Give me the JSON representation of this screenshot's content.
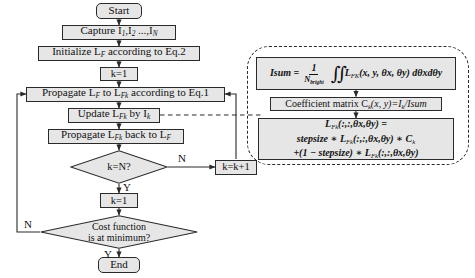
{
  "diagram": {
    "colors": {
      "node_fill": "#e6e6e6",
      "stroke": "#2a2a2a",
      "text": "#111111",
      "background": "#ffffff"
    },
    "nodes": {
      "start": "Start",
      "capture": "Capture I",
      "capture_sub1": "1",
      "capture_mid": ",I",
      "capture_sub2": "2",
      "capture_tail": " ...,I",
      "capture_subN": "N",
      "initialize": "Initialize L",
      "initialize_sub": "F",
      "initialize_tail": " according to Eq.2",
      "k_init": "k=1",
      "propagate_fwd_a": "Propagate L",
      "propagate_fwd_sub1": "F",
      "propagate_fwd_b": "  to L",
      "propagate_fwd_sub2": "Fk",
      "propagate_fwd_c": " according to Eq.1",
      "update_a": "Update L",
      "update_sub1": "Fk",
      "update_b": " by I",
      "update_sub2": "k",
      "propagate_back_a": "Propagate L",
      "propagate_back_sub1": "Fk",
      "propagate_back_b": "  back to L",
      "propagate_back_sub2": "F",
      "decision_k": "k=N?",
      "increment": "k=k+1",
      "k_reset": "k=1",
      "decision_cost_line1": "Cost function",
      "decision_cost_line2": "is at minimum?",
      "end": "End"
    },
    "edge_labels": {
      "k_no": "N",
      "k_yes": "Y",
      "cost_no": "N",
      "cost_yes": "Y"
    },
    "panel": {
      "eq_isum": {
        "lhs": "Isum",
        "equals": "=",
        "frac_num": "1",
        "frac_den": "N",
        "frac_den_sub": "bright",
        "integral": "∬",
        "body": "L",
        "body_sub": "FK",
        "args": "(x, y, θx, θy)",
        "differential": "dθxdθy"
      },
      "eq_coeff": {
        "prefix": "Coefficient matrix C",
        "sub1": "k",
        "args": "(x, y)=I",
        "sub2": "k",
        "suffix": "/Isum"
      },
      "eq_update": {
        "line1_a": "L",
        "line1_sub": "Fk",
        "line1_b": "(:,:,θx,θy) =",
        "line2_a": "stepsize ∗ L",
        "line2_sub1": "Fk",
        "line2_b": "(:,:,θx,θy) ∗ C",
        "line2_sub2": "k",
        "line3_a": "+(1 − stepsize) ∗ L",
        "line3_sub": "Fk",
        "line3_b": "(:,:,θx,θy)"
      }
    }
  }
}
